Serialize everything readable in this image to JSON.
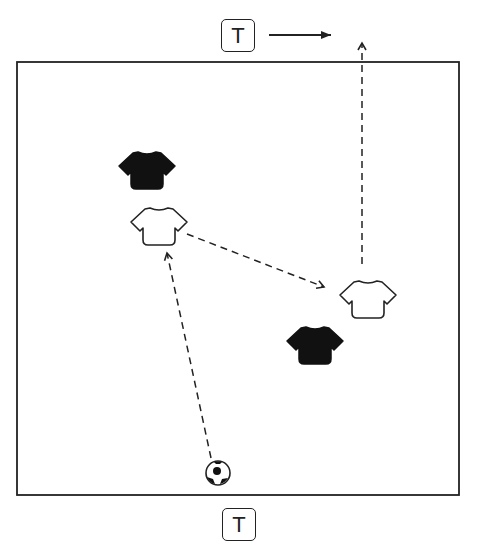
{
  "diagram": {
    "type": "soccer-drill",
    "field": {
      "x": 17,
      "y": 62,
      "width": 442,
      "height": 433,
      "border_color": "#222222"
    },
    "targets": [
      {
        "id": "top-target",
        "label": "T",
        "x": 221,
        "y": 19
      },
      {
        "id": "bottom-target",
        "label": "T",
        "x": 222,
        "y": 508
      }
    ],
    "players": [
      {
        "id": "defender-1",
        "team": "black",
        "x": 147,
        "y": 167
      },
      {
        "id": "attacker-1",
        "team": "white",
        "x": 159,
        "y": 223
      },
      {
        "id": "attacker-2",
        "team": "white",
        "x": 367,
        "y": 297
      },
      {
        "id": "defender-2",
        "team": "black",
        "x": 315,
        "y": 342
      }
    ],
    "ball": {
      "x": 217,
      "y": 474
    },
    "arrows": [
      {
        "id": "pass-from-ball",
        "style": "dashed",
        "from": [
          211,
          458
        ],
        "to": [
          167,
          252
        ]
      },
      {
        "id": "pass-to-attacker-2",
        "style": "dashed",
        "from": [
          187,
          234
        ],
        "to": [
          324,
          287
        ]
      },
      {
        "id": "run-upfield",
        "style": "dashed",
        "from": [
          362,
          264
        ],
        "to": [
          362,
          42
        ]
      },
      {
        "id": "direction-of-play",
        "style": "solid",
        "from": [
          269,
          35
        ],
        "to": [
          331,
          35
        ]
      }
    ],
    "colors": {
      "line": "#222222",
      "black_team": "#111111",
      "white_team": "#ffffff"
    }
  }
}
